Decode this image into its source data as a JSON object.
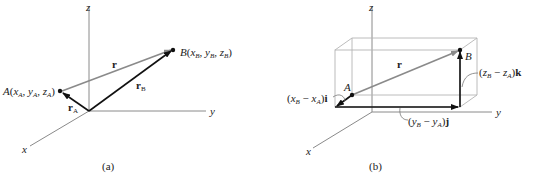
{
  "panels": [
    {
      "id": "a",
      "caption": "(a)",
      "axes": {
        "x": "x",
        "y": "y",
        "z": "z"
      },
      "points": {
        "A": {
          "name": "A",
          "coords": "(x",
          "label_full": "A(xA, yA, zA)"
        },
        "B": {
          "name": "B",
          "label_full": "B(xB, yB, zB)"
        }
      },
      "vectors": {
        "r": "r",
        "rA": "r",
        "rA_sub": "A",
        "rB": "r",
        "rB_sub": "B"
      }
    },
    {
      "id": "b",
      "caption": "(b)",
      "axes": {
        "x": "x",
        "y": "y",
        "z": "z"
      },
      "points": {
        "A": "A",
        "B": "B"
      },
      "vectors": {
        "r": "r"
      },
      "components": {
        "x": {
          "label": "(xB − xA)i"
        },
        "y": {
          "label": "(yB − yA)j"
        },
        "z": {
          "label": "(zB − zA)k"
        }
      }
    }
  ],
  "text": {
    "a_caption": "(a)",
    "b_caption": "(b)",
    "x": "x",
    "y": "y",
    "z": "z",
    "A": "A",
    "B": "B",
    "r": "r",
    "sub_A": "A",
    "sub_B": "B",
    "open": "(",
    "close": ")",
    "comma": ", ",
    "minus": " − ",
    "i": "i",
    "j": "j",
    "k": "k"
  }
}
